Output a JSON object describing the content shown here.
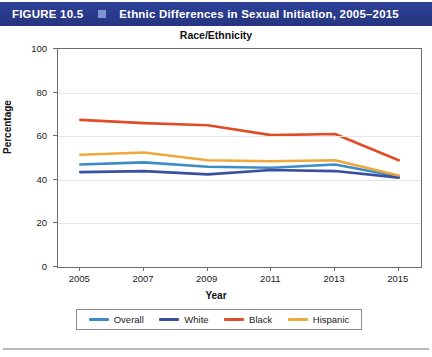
{
  "caption": {
    "figure_label": "FIGURE 10.5",
    "separator_icon": "square-bullet-icon",
    "title": "Ethnic Differences in Sexual Initiation, 2005–2015",
    "bar_color": "#2b3d91",
    "separator_color": "#7d95d8",
    "text_color": "#ffffff"
  },
  "chart_data": {
    "type": "line",
    "title": "Race/Ethnicity",
    "xlabel": "Year",
    "ylabel": "Percentage",
    "x": [
      2005,
      2007,
      2009,
      2011,
      2013,
      2015
    ],
    "xticklabels": [
      "2005",
      "2007",
      "2009",
      "2011",
      "2013",
      "2015"
    ],
    "yticks": [
      0,
      20,
      40,
      60,
      80,
      100
    ],
    "yticklabels": [
      "0",
      "20",
      "40",
      "60",
      "80",
      "100"
    ],
    "ylim": [
      0,
      100
    ],
    "xlim": [
      2004.3,
      2015.7
    ],
    "grid": true,
    "legend_position": "below-axes",
    "series": [
      {
        "name": "Overall",
        "color": "#3c8dc5",
        "values": [
          47.0,
          48.0,
          46.0,
          45.5,
          47.0,
          41.5
        ]
      },
      {
        "name": "White",
        "color": "#3b4fa0",
        "values": [
          43.5,
          44.0,
          42.5,
          44.5,
          44.0,
          41.0
        ]
      },
      {
        "name": "Black",
        "color": "#e04e27",
        "values": [
          67.5,
          66.0,
          65.0,
          60.5,
          61.0,
          49.0
        ]
      },
      {
        "name": "Hispanic",
        "color": "#efa83c",
        "values": [
          51.5,
          52.5,
          49.0,
          48.5,
          49.0,
          42.0
        ]
      }
    ]
  }
}
